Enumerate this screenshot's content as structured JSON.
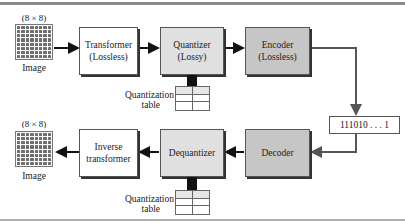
{
  "diagram": {
    "top_row": {
      "image_size_label": "(8 × 8)",
      "image_label": "Image",
      "transformer": {
        "line1": "Transformer",
        "line2": "(Lossless)"
      },
      "quantizer": {
        "line1": "Quantizer",
        "line2": "(Lossy)"
      },
      "encoder": {
        "line1": "Encoder",
        "line2": "(Lossless)"
      },
      "quant_table_label": {
        "line1": "Quantization",
        "line2": "table"
      }
    },
    "bitstream": "111010 . . . 1",
    "bottom_row": {
      "image_size_label": "(8 × 8)",
      "image_label": "Image",
      "inverse_transformer": {
        "line1": "Inverse",
        "line2": "transformer"
      },
      "dequantizer": {
        "line1": "Dequantizer"
      },
      "decoder": {
        "line1": "Decoder"
      },
      "quant_table_label": {
        "line1": "Quantization",
        "line2": "table"
      }
    },
    "colors": {
      "transformer_fill": "#ffffff",
      "quantizer_fill": "#e0e0e0",
      "encoder_fill": "#c6c6c6",
      "arrow": "#111111",
      "connector": "#555555"
    }
  }
}
